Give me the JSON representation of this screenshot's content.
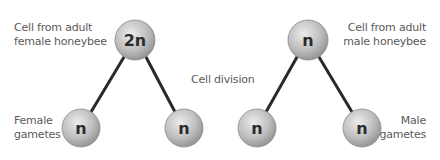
{
  "labels": {
    "female_parent": [
      "Cell from adult",
      "female honeybee"
    ],
    "male_parent": [
      "Cell from adult",
      "male honeybee"
    ],
    "center": "Cell division",
    "female_gametes": [
      "Female",
      "gametes"
    ],
    "male_gametes": [
      "Male",
      "gametes"
    ]
  },
  "cells": {
    "female_parent": "2n",
    "female_gamete_1": "n",
    "female_gamete_2": "n",
    "male_parent": "n",
    "male_gamete_1": "n",
    "male_gamete_2": "n"
  },
  "colors": {
    "cell_fill_light": "#e6e6e6",
    "cell_fill_dark": "#9a9a9a",
    "line": "#2a2a2a",
    "text": "#5a5a5a"
  }
}
